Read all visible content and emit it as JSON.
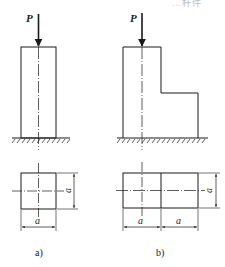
{
  "header": {
    "partial_caption": "…杆件"
  },
  "figures": [
    {
      "id": "a",
      "label": "a)",
      "load_label": "P",
      "dimension_labels": {
        "width": "a",
        "height": "a"
      },
      "description": "Prismatic column of square cross-section a×a, fixed at base, axial load P at top"
    },
    {
      "id": "b",
      "label": "b)",
      "load_label": "P",
      "dimension_labels": {
        "width_left": "a",
        "width_right": "a",
        "height": "a"
      },
      "description": "Stepped column: full-height a×a part plus lower a×a part attached, load P on the tall part's axis"
    }
  ],
  "colors": {
    "line": "#1a1a1a",
    "faint_text": "#bdbdbd"
  }
}
